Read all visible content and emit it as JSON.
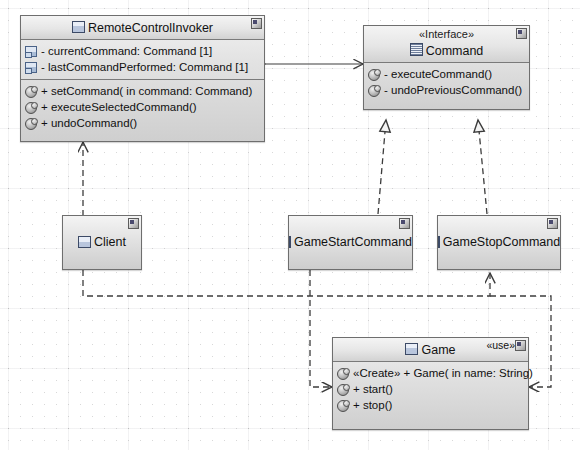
{
  "diagram": {
    "type": "uml-class-diagram",
    "canvas": {
      "width": 580,
      "height": 450
    },
    "colors": {
      "box_border": "#6e6e6e",
      "box_fill_top": "#f2f2f2",
      "box_fill_bottom": "#cfcfcf",
      "header_fill_top": "#f4f4f4",
      "header_fill_bottom": "#d2d2d2",
      "line": "#3c3c3c",
      "grid": "#d8d8d8",
      "background": "#ffffff"
    }
  },
  "classes": {
    "remote_control_invoker": {
      "name": "RemoteControlInvoker",
      "icon": "class-icon",
      "attributes": [
        {
          "icon": "attribute-icon",
          "text": "- currentCommand: Command [1]"
        },
        {
          "icon": "attribute-icon",
          "text": "- lastCommandPerformed: Command [1]"
        }
      ],
      "operations": [
        {
          "icon": "operation-icon",
          "text": "+ setCommand(  in command: Command)"
        },
        {
          "icon": "operation-icon",
          "text": "+ executeSelectedCommand()"
        },
        {
          "icon": "operation-icon",
          "text": "+ undoCommand()"
        }
      ]
    },
    "command": {
      "stereotype": "«Interface»",
      "name": "Command",
      "icon": "interface-icon",
      "operations": [
        {
          "icon": "operation-icon",
          "text": "- executeCommand()"
        },
        {
          "icon": "operation-icon",
          "text": "- undoPreviousCommand()"
        }
      ]
    },
    "client": {
      "name": "Client",
      "icon": "class-icon"
    },
    "game_start_command": {
      "name": "GameStartCommand",
      "icon": "class-icon"
    },
    "game_stop_command": {
      "name": "GameStopCommand",
      "icon": "class-icon"
    },
    "game": {
      "name": "Game",
      "icon": "class-icon",
      "tag": "«use»",
      "operations": [
        {
          "icon": "operation-icon",
          "text": "«Create»  + Game(  in name: String)"
        },
        {
          "icon": "operation-icon",
          "text": "+ start()"
        },
        {
          "icon": "operation-icon",
          "text": "+ stop()"
        }
      ]
    }
  },
  "relationships": [
    {
      "name": "invoker-aggregates-command",
      "from": "RemoteControlInvoker",
      "to": "Command",
      "type": "aggregation-directed"
    },
    {
      "name": "gamestart-realizes-command",
      "from": "GameStartCommand",
      "to": "Command",
      "type": "realization"
    },
    {
      "name": "gamestop-realizes-command",
      "from": "GameStopCommand",
      "to": "Command",
      "type": "realization"
    },
    {
      "name": "client-depends-invoker",
      "from": "Client",
      "to": "RemoteControlInvoker",
      "type": "dependency"
    },
    {
      "name": "client-depends-gamestop",
      "from": "Client",
      "to": "GameStopCommand",
      "type": "dependency"
    },
    {
      "name": "client-depends-game",
      "from": "Client",
      "to": "Game",
      "type": "dependency"
    },
    {
      "name": "gamestart-depends-game",
      "from": "GameStartCommand",
      "to": "Game",
      "type": "dependency"
    }
  ]
}
